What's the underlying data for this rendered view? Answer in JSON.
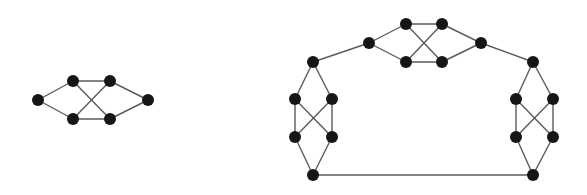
{
  "colors": {
    "node": "#161616",
    "edge": "#5a5a5a",
    "background": "#ffffff"
  },
  "node_radius": 6,
  "graphs": [
    {
      "name": "small-graph",
      "nodes": [
        {
          "id": "a1",
          "x": 38,
          "y": 100
        },
        {
          "id": "a2",
          "x": 73,
          "y": 81
        },
        {
          "id": "a3",
          "x": 110,
          "y": 81
        },
        {
          "id": "a4",
          "x": 73,
          "y": 119
        },
        {
          "id": "a5",
          "x": 110,
          "y": 119
        },
        {
          "id": "a6",
          "x": 148,
          "y": 100
        }
      ],
      "edges": [
        [
          "a1",
          "a2"
        ],
        [
          "a1",
          "a4"
        ],
        [
          "a2",
          "a3"
        ],
        [
          "a4",
          "a5"
        ],
        [
          "a2",
          "a5"
        ],
        [
          "a4",
          "a3"
        ],
        [
          "a3",
          "a6"
        ],
        [
          "a5",
          "a6"
        ]
      ]
    },
    {
      "name": "large-graph",
      "nodes": [
        {
          "id": "t1",
          "x": 369,
          "y": 43
        },
        {
          "id": "t2",
          "x": 406,
          "y": 24
        },
        {
          "id": "t3",
          "x": 442,
          "y": 24
        },
        {
          "id": "t4",
          "x": 406,
          "y": 62
        },
        {
          "id": "t5",
          "x": 442,
          "y": 62
        },
        {
          "id": "t6",
          "x": 481,
          "y": 43
        },
        {
          "id": "l1",
          "x": 313,
          "y": 62
        },
        {
          "id": "l2",
          "x": 295,
          "y": 99
        },
        {
          "id": "l3",
          "x": 332,
          "y": 99
        },
        {
          "id": "l4",
          "x": 295,
          "y": 137
        },
        {
          "id": "l5",
          "x": 332,
          "y": 137
        },
        {
          "id": "l6",
          "x": 313,
          "y": 175
        },
        {
          "id": "r1",
          "x": 533,
          "y": 62
        },
        {
          "id": "r2",
          "x": 516,
          "y": 99
        },
        {
          "id": "r3",
          "x": 553,
          "y": 99
        },
        {
          "id": "r4",
          "x": 516,
          "y": 137
        },
        {
          "id": "r5",
          "x": 553,
          "y": 137
        },
        {
          "id": "r6",
          "x": 533,
          "y": 175
        }
      ],
      "edges": [
        [
          "t1",
          "t2"
        ],
        [
          "t1",
          "t4"
        ],
        [
          "t2",
          "t3"
        ],
        [
          "t4",
          "t5"
        ],
        [
          "t2",
          "t5"
        ],
        [
          "t4",
          "t3"
        ],
        [
          "t3",
          "t6"
        ],
        [
          "t5",
          "t6"
        ],
        [
          "l1",
          "t1"
        ],
        [
          "t6",
          "r1"
        ],
        [
          "l1",
          "l2"
        ],
        [
          "l1",
          "l3"
        ],
        [
          "l2",
          "l4"
        ],
        [
          "l3",
          "l5"
        ],
        [
          "l2",
          "l5"
        ],
        [
          "l3",
          "l4"
        ],
        [
          "l4",
          "l6"
        ],
        [
          "l5",
          "l6"
        ],
        [
          "r1",
          "r2"
        ],
        [
          "r1",
          "r3"
        ],
        [
          "r2",
          "r4"
        ],
        [
          "r3",
          "r5"
        ],
        [
          "r2",
          "r5"
        ],
        [
          "r3",
          "r4"
        ],
        [
          "r4",
          "r6"
        ],
        [
          "r5",
          "r6"
        ],
        [
          "l6",
          "r6"
        ]
      ]
    }
  ]
}
